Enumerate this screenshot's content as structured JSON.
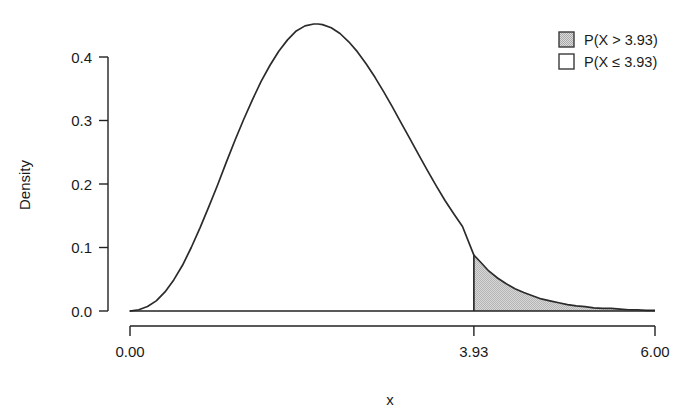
{
  "chart_data": {
    "type": "area",
    "title": "",
    "xlabel": "x",
    "ylabel": "Density",
    "xlim": [
      0,
      6
    ],
    "ylim": [
      0,
      0.46
    ],
    "grid": false,
    "legend_position": "top-right",
    "x_ticks": [
      {
        "value": 0,
        "label": "0.00"
      },
      {
        "value": 3.93,
        "label": "3.93"
      },
      {
        "value": 6,
        "label": "6.00"
      }
    ],
    "y_ticks": [
      {
        "value": 0.0,
        "label": "0.0"
      },
      {
        "value": 0.1,
        "label": "0.1"
      },
      {
        "value": 0.2,
        "label": "0.2"
      },
      {
        "value": 0.3,
        "label": "0.3"
      },
      {
        "value": 0.4,
        "label": "0.4"
      }
    ],
    "cutoff": 3.93,
    "cutoff_density": 0.088,
    "peak": {
      "x": 2.15,
      "y": 0.452
    },
    "series": [
      {
        "name": "density",
        "x": [
          0.0,
          0.1,
          0.2,
          0.3,
          0.4,
          0.5,
          0.6,
          0.7,
          0.8,
          0.9,
          1.0,
          1.1,
          1.2,
          1.3,
          1.4,
          1.5,
          1.6,
          1.7,
          1.8,
          1.9,
          2.0,
          2.1,
          2.15,
          2.2,
          2.3,
          2.4,
          2.5,
          2.6,
          2.7,
          2.8,
          2.9,
          3.0,
          3.1,
          3.2,
          3.3,
          3.4,
          3.5,
          3.6,
          3.7,
          3.8,
          3.93,
          4.0,
          4.1,
          4.2,
          4.3,
          4.4,
          4.5,
          4.6,
          4.7,
          4.8,
          4.9,
          5.0,
          5.1,
          5.2,
          5.3,
          5.4,
          5.5,
          5.6,
          5.7,
          5.8,
          5.9,
          6.0
        ],
        "y": [
          0.0,
          0.002,
          0.007,
          0.016,
          0.03,
          0.049,
          0.072,
          0.1,
          0.131,
          0.164,
          0.198,
          0.234,
          0.269,
          0.302,
          0.333,
          0.362,
          0.387,
          0.409,
          0.427,
          0.441,
          0.449,
          0.452,
          0.452,
          0.451,
          0.446,
          0.437,
          0.424,
          0.408,
          0.389,
          0.368,
          0.345,
          0.321,
          0.296,
          0.271,
          0.246,
          0.221,
          0.197,
          0.174,
          0.153,
          0.133,
          0.088,
          0.078,
          0.063,
          0.052,
          0.043,
          0.035,
          0.029,
          0.024,
          0.019,
          0.016,
          0.013,
          0.01,
          0.008,
          0.007,
          0.005,
          0.004,
          0.004,
          0.003,
          0.002,
          0.002,
          0.001,
          0.001
        ]
      }
    ],
    "shaded_region": {
      "label": "P(X > 3.93)",
      "from": 3.93,
      "to": 6.0,
      "fill_color": "#c9c9c9",
      "edge_color": "#2b2b2b"
    },
    "unshaded_region": {
      "label": "P(X ≤ 3.93)",
      "from": 0.0,
      "to": 3.93,
      "fill_color": "#ffffff",
      "edge_color": "#2b2b2b"
    },
    "legend": [
      {
        "label": "P(X > 3.93)",
        "swatch": "gray-filled-square",
        "color": "#c9c9c9"
      },
      {
        "label": "P(X ≤ 3.93)",
        "swatch": "white-square",
        "color": "#ffffff"
      }
    ]
  },
  "colors": {
    "background": "#ffffff",
    "axis": "#222222",
    "curve": "#2b2b2b",
    "shade": "#c9c9c9",
    "text": "#1a1a1a"
  }
}
